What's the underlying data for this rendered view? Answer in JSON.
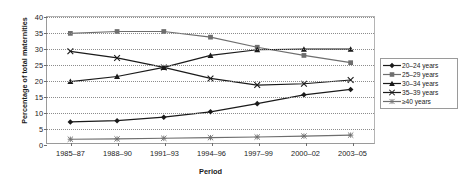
{
  "chart_data": {
    "type": "line",
    "title": "",
    "xlabel": "Period",
    "ylabel": "Percentage of total maternities",
    "categories": [
      "1985–87",
      "1988–90",
      "1991–93",
      "1994–96",
      "1997–99",
      "2000–02",
      "2003–05"
    ],
    "ylim": [
      0,
      40
    ],
    "yticks": [
      0,
      5,
      10,
      15,
      20,
      25,
      30,
      35,
      40
    ],
    "ytick_labels": [
      "0",
      "5",
      "10",
      "15",
      "20",
      "25",
      "30",
      "35",
      "40"
    ],
    "grid": true,
    "grid_axis": "y",
    "legend_position": "right",
    "series": [
      {
        "name": "20–24 years",
        "marker": "diamond",
        "color": "#1a1a1a",
        "values": [
          6.7,
          7.1,
          8.2,
          9.9,
          12.5,
          15.3,
          17.0
        ]
      },
      {
        "name": "25–29 years",
        "marker": "square",
        "color": "#6e6e6e",
        "values": [
          34.8,
          35.4,
          35.4,
          33.6,
          30.4,
          27.8,
          25.5
        ]
      },
      {
        "name": "30–34 years",
        "marker": "triangle",
        "color": "#1a1a1a",
        "values": [
          19.5,
          21.1,
          24.0,
          27.8,
          29.6,
          29.8,
          29.8
        ]
      },
      {
        "name": "35–39 years",
        "marker": "cross",
        "color": "#1a1a1a",
        "values": [
          29.1,
          27.0,
          24.0,
          20.5,
          18.4,
          18.8,
          20.0
        ]
      },
      {
        "name": "≥40 years",
        "marker": "asterisk",
        "color": "#6e6e6e",
        "values": [
          1.2,
          1.3,
          1.5,
          1.7,
          1.9,
          2.2,
          2.5
        ]
      }
    ]
  }
}
